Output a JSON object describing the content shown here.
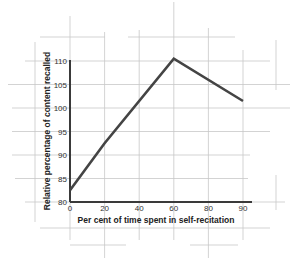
{
  "chart_data": {
    "type": "line",
    "title": "",
    "xlabel": "Per cent of time spent in self-recitation",
    "ylabel": "Relative percentage of content recalled",
    "x_ticks": [
      "0",
      "20",
      "40",
      "60",
      "80",
      "90"
    ],
    "y_ticks": [
      "80",
      "85",
      "90",
      "95",
      "100",
      "105",
      "110"
    ],
    "xlim": [
      0,
      100
    ],
    "ylim": [
      80,
      110
    ],
    "grid": true,
    "legend": null,
    "series": [
      {
        "name": "Relative recall",
        "x": [
          0,
          20,
          60,
          90
        ],
        "y": [
          82.5,
          92.5,
          110.5,
          101.5
        ],
        "color": "#444444"
      }
    ]
  },
  "colors": {
    "grid": "#c8c8c8",
    "axis": "#3a3a3a",
    "line": "#444444"
  }
}
